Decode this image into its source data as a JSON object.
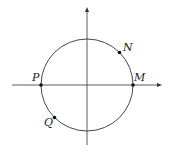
{
  "diagram": {
    "type": "unit-circle",
    "colors": {
      "stroke": "#333333",
      "point": "#111111",
      "background": "#ffffff"
    },
    "axes": {
      "horizontal": {
        "x1": 12,
        "x2": 162,
        "y": 85,
        "arrow": "right"
      },
      "vertical": {
        "x": 87,
        "y1": 145,
        "y2": 8,
        "arrow": "up"
      }
    },
    "circle": {
      "cx": 87,
      "cy": 85,
      "r": 46
    },
    "points": [
      {
        "id": "M",
        "label": "M",
        "angle_deg": 0
      },
      {
        "id": "N",
        "label": "N",
        "angle_deg": 45
      },
      {
        "id": "P",
        "label": "P",
        "angle_deg": 180
      },
      {
        "id": "Q",
        "label": "Q",
        "angle_deg": 225
      }
    ]
  }
}
